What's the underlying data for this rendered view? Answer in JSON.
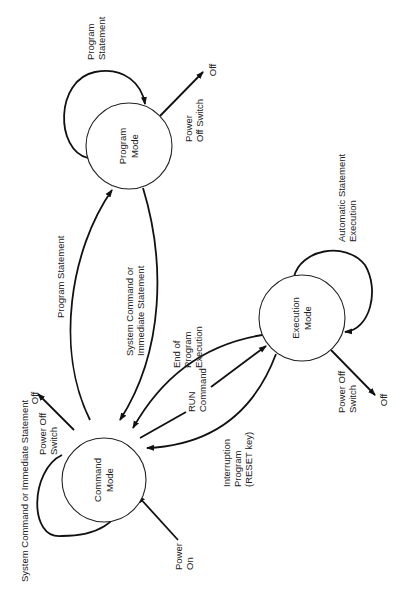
{
  "diagram": {
    "type": "state-transition",
    "nodes": {
      "command": {
        "line1": "Command",
        "line2": "Mode"
      },
      "program": {
        "line1": "Program",
        "line2": "Mode"
      },
      "execution": {
        "line1": "Execution",
        "line2": "Mode"
      }
    },
    "edges": {
      "program_self": {
        "line1": "Program",
        "line2": "Statement"
      },
      "program_off": {
        "label_line1": "Power",
        "label_line2": "Off Switch",
        "target": "Off"
      },
      "cmd_to_program": {
        "line1": "Program Statement"
      },
      "program_to_cmd": {
        "line1": "System Command or",
        "line2": "Immediate Statement"
      },
      "cmd_self": {
        "line1": "System Command or Immediate Statement"
      },
      "cmd_off": {
        "label_line1": "Power Off",
        "label_line2": "Switch",
        "target": "Off"
      },
      "power_on": {
        "line1": "Power",
        "line2": "On"
      },
      "exec_to_cmd_end": {
        "line1": "End of",
        "line2": "Program",
        "line3": "Execution"
      },
      "cmd_to_exec_run": {
        "line1": "RUN",
        "line2": "Command"
      },
      "exec_to_cmd_interrupt": {
        "line1": "Interruption",
        "line2": "Program",
        "line3": "(RESET key)"
      },
      "exec_self": {
        "line1": "Automatic Statement",
        "line2": "Execution"
      },
      "exec_off": {
        "label_line1": "Power Off",
        "label_line2": "Switch",
        "target": "Off"
      }
    }
  }
}
